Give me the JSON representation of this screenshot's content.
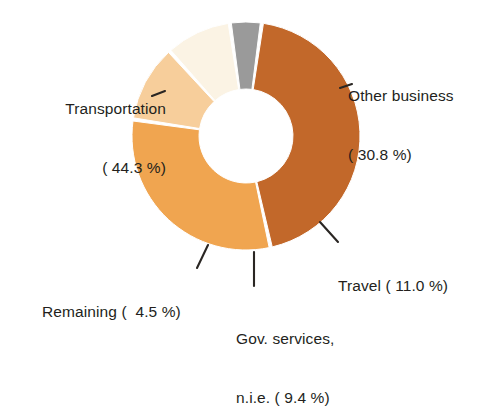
{
  "chart_data": {
    "type": "pie",
    "variant": "donut",
    "title": "",
    "subtitle": "",
    "xlabel": "",
    "ylabel": "",
    "units": "%",
    "legend": "none",
    "grid": false,
    "categories": [
      "Transportation",
      "Other business",
      "Travel",
      "Gov. services, n.i.e.",
      "Remaining"
    ],
    "values": [
      44.3,
      30.8,
      11.0,
      9.4,
      4.5
    ],
    "colors": [
      "#C2682A",
      "#F0A550",
      "#F7CE9B",
      "#FBF3E4",
      "#9A9A9A"
    ],
    "slices": [
      {
        "name": "Transportation",
        "value": 44.3,
        "color": "#C2682A",
        "label_lines": [
          "Transportation",
          "( 44.3 %)"
        ],
        "label_position": "left"
      },
      {
        "name": "Other business",
        "value": 30.8,
        "color": "#F0A550",
        "label_lines": [
          "Other business",
          "( 30.8 %)"
        ],
        "label_position": "right"
      },
      {
        "name": "Travel",
        "value": 11.0,
        "color": "#F7CE9B",
        "label_lines": [
          "Travel ( 11.0 %)"
        ],
        "label_position": "bottom-right"
      },
      {
        "name": "Gov. services, n.i.e.",
        "value": 9.4,
        "color": "#FBF3E4",
        "label_lines": [
          "Gov. services,",
          "n.i.e. ( 9.4 %)"
        ],
        "label_position": "bottom"
      },
      {
        "name": "Remaining",
        "value": 4.5,
        "color": "#9A9A9A",
        "label_lines": [
          "Remaining (  4.5 %)"
        ],
        "label_position": "bottom-left"
      }
    ],
    "geometry": {
      "center_x": 246,
      "center_y": 136,
      "outer_radius": 114,
      "inner_radius": 47,
      "start_angle_deg": 8,
      "gap_deg": 1.6
    },
    "background": "#FFFFFF",
    "text_color": "#231F1C",
    "leader_color": "#2A2623"
  }
}
